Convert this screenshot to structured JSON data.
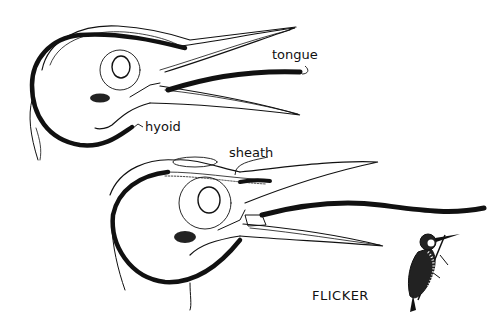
{
  "diagram": {
    "labels": {
      "tongue": "tongue",
      "hyoid": "hyoid",
      "sheath": "sheath"
    },
    "caption": "FLICKER",
    "figures": [
      {
        "name": "head-tongue-retracted",
        "labels": [
          "tongue",
          "hyoid"
        ]
      },
      {
        "name": "head-tongue-extended",
        "labels": [
          "sheath"
        ]
      },
      {
        "name": "flicker-bird-perched",
        "labels": []
      }
    ],
    "colors": {
      "ink": "#111111",
      "paper": "#ffffff"
    }
  }
}
